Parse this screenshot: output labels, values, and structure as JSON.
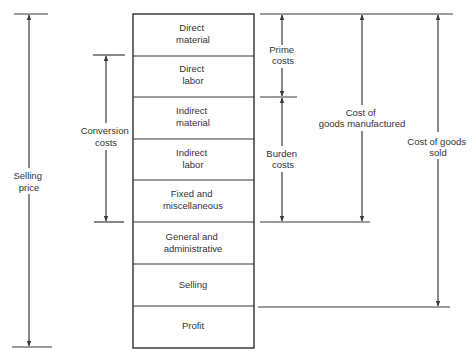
{
  "diagram": {
    "title": "",
    "rows": [
      {
        "lines": [
          "Direct",
          "material"
        ]
      },
      {
        "lines": [
          "Direct",
          "labor"
        ]
      },
      {
        "lines": [
          "Indirect",
          "material"
        ]
      },
      {
        "lines": [
          "Indirect",
          "labor"
        ]
      },
      {
        "lines": [
          "Fixed and",
          "miscellaneous"
        ]
      },
      {
        "lines": [
          "General and",
          "administrative"
        ]
      },
      {
        "lines": [
          "Selling"
        ]
      },
      {
        "lines": [
          "Profit"
        ]
      }
    ],
    "brackets": {
      "selling_price": {
        "lines": [
          "Selling",
          "price"
        ],
        "spans": "Direct material through Profit"
      },
      "conversion_costs": {
        "lines": [
          "Conversion",
          "costs"
        ],
        "spans": "Direct labor through Fixed and miscellaneous"
      },
      "prime_costs": {
        "lines": [
          "Prime",
          "costs"
        ],
        "spans": "Direct material through Direct labor"
      },
      "burden_costs": {
        "lines": [
          "Burden",
          "costs"
        ],
        "spans": "Indirect material through Fixed and miscellaneous"
      },
      "cost_of_goods_manufactured": {
        "lines": [
          "Cost of",
          "goods manufactured"
        ],
        "spans": "Direct material through Fixed and miscellaneous"
      },
      "cost_of_goods_sold": {
        "lines": [
          "Cost of goods",
          "sold"
        ],
        "spans": "Direct material through Selling"
      }
    }
  }
}
